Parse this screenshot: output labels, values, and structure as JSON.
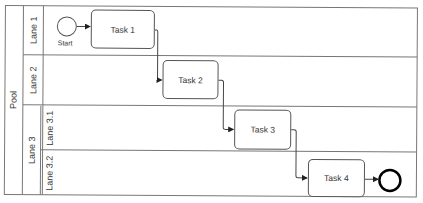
{
  "diagram": {
    "type": "BPMN swimlane process",
    "pool": {
      "label": "Pool"
    },
    "lanes": [
      {
        "id": "lane1",
        "label": "Lane 1"
      },
      {
        "id": "lane2",
        "label": "Lane 2"
      },
      {
        "id": "lane3",
        "label": "Lane 3",
        "sublanes": [
          {
            "id": "lane3_1",
            "label": "Lane 3.1"
          },
          {
            "id": "lane3_2",
            "label": "Lane 3.2"
          }
        ]
      }
    ],
    "start_event": {
      "label": "Start",
      "lane": "Lane 1"
    },
    "tasks": [
      {
        "label": "Task 1",
        "lane": "Lane 1"
      },
      {
        "label": "Task 2",
        "lane": "Lane 2"
      },
      {
        "label": "Task 3",
        "lane": "Lane 3.1"
      },
      {
        "label": "Task 4",
        "lane": "Lane 3.2"
      }
    ],
    "end_event": {
      "label": "",
      "lane": "Lane 3.2"
    },
    "flows": [
      [
        "Start",
        "Task 1"
      ],
      [
        "Task 1",
        "Task 2"
      ],
      [
        "Task 2",
        "Task 3"
      ],
      [
        "Task 3",
        "Task 4"
      ],
      [
        "Task 4",
        "End"
      ]
    ],
    "colors": {
      "line": "#555555",
      "text": "#333333",
      "end_event": "#000000"
    }
  }
}
